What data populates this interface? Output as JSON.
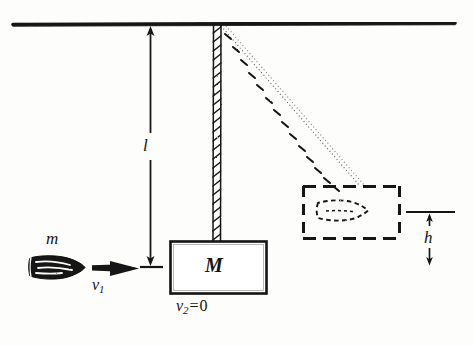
{
  "figure": {
    "background_color": "#fdfdfb",
    "ink_color": "#141414"
  },
  "labels": {
    "bullet_mass": "m",
    "bullet_velocity": "v",
    "bullet_velocity_subscript": "1",
    "cord_length": "l",
    "block_mass": "M",
    "block_velocity": "v",
    "block_velocity_subscript": "2",
    "block_velocity_equals": "=",
    "block_velocity_value": "0",
    "rise_height": "h"
  },
  "elements": {
    "ceiling_name": "ceiling-support-line",
    "cord_name": "pendulum-cord-vertical",
    "swung_cord_name": "pendulum-cord-swung",
    "block_name": "pendulum-block",
    "displaced_block_name": "displaced-block-dashed",
    "bullet_name": "bullet",
    "embedded_bullet_name": "embedded-bullet-dashed",
    "velocity_arrow_name": "bullet-velocity-arrow",
    "length_dimension_name": "cord-length-dimension",
    "height_dimension_name": "rise-height-dimension",
    "baseline_name": "baseline-reference-line"
  }
}
